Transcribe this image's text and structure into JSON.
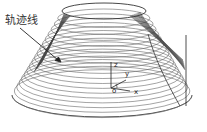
{
  "figure": {
    "type": "toolpath-diagram",
    "annotation": {
      "label": "轨迹线",
      "meaning": "trajectory line"
    },
    "axes": {
      "z_label": "z",
      "y_label": "y",
      "origin_label": "o",
      "x_label": "x"
    },
    "colors": {
      "background": "#ffffff",
      "lines": "#555555",
      "dense_lines": "#333333",
      "text": "#333333"
    },
    "geometry": {
      "top_ellipse": {
        "cx": 104,
        "cy": 11,
        "rx": 42,
        "ry": 8
      },
      "bottom_ellipse": {
        "cx": 102,
        "cy": 95,
        "rx": 90,
        "ry": 22
      },
      "contour_count": 18
    }
  }
}
